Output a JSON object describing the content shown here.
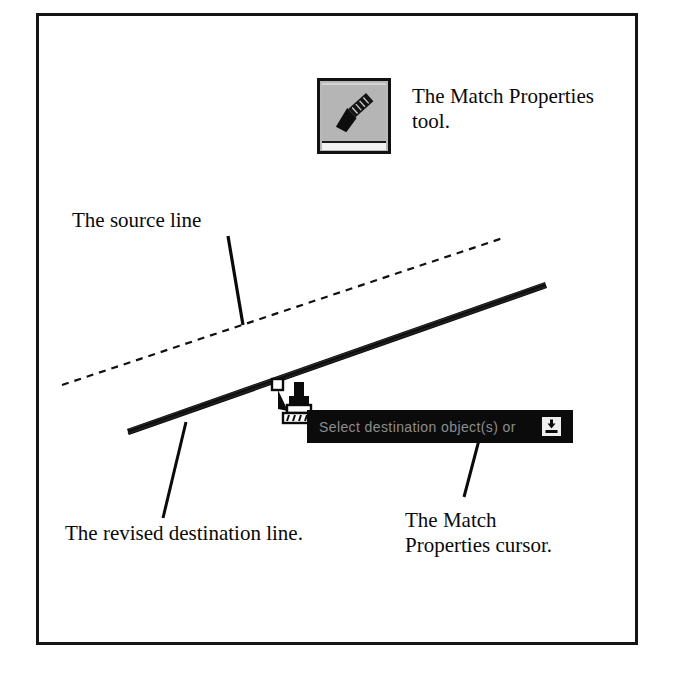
{
  "figure": {
    "name": "match-properties-figure",
    "background_color": "#ffffff",
    "frame_color": "#151515"
  },
  "toolbar": {
    "tool_name": "match-properties-tool",
    "icon": "paintbrush-icon",
    "button_face_color": "#b5b5b5",
    "button_border_color": "#111111",
    "caption": "The Match Properties\ntool."
  },
  "annotations": {
    "source_line_label": "The source line",
    "destination_line_label": "The revised destination line.",
    "cursor_label": "The Match\nProperties cursor."
  },
  "command_tooltip": {
    "prompt": "Select destination object(s) or",
    "dropdown_icon": "dropdown-arrow-icon",
    "background_color": "#0b0b0b",
    "text_color": "#8d8d8d"
  },
  "cursor": {
    "icon": "paintbrush-cursor-icon",
    "pickbox": "pickbox-square"
  },
  "geometry": {
    "source_line": {
      "style": "dashed",
      "color": "#111111",
      "x1": 62,
      "y1": 385,
      "x2": 506,
      "y2": 237
    },
    "destination_line": {
      "style": "solid-thick",
      "color": "#0c0c0c",
      "x1": 128,
      "y1": 432,
      "x2": 546,
      "y2": 285
    },
    "leaders": [
      {
        "name": "source-line-leader",
        "x1": 228,
        "y1": 236,
        "x2": 243,
        "y2": 325
      },
      {
        "name": "destination-line-leader",
        "x1": 186,
        "y1": 422,
        "x2": 163,
        "y2": 518
      },
      {
        "name": "cursor-leader",
        "x1": 479,
        "y1": 440,
        "x2": 464,
        "y2": 497
      }
    ]
  }
}
